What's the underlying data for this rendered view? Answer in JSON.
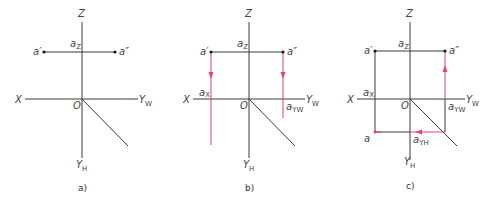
{
  "figure": {
    "panels": [
      {
        "id": "a",
        "caption": "a)",
        "labels": {
          "z": "Z",
          "x": "X",
          "o": "O",
          "yw": "Y",
          "yw_sub": "W",
          "yh": "Y",
          "yh_sub": "H",
          "a_front": "a′",
          "a_side": "a″",
          "az": "a",
          "az_sub": "Z"
        }
      },
      {
        "id": "b",
        "caption": "b)",
        "labels": {
          "z": "Z",
          "x": "X",
          "o": "O",
          "yw": "Y",
          "yw_sub": "W",
          "yh": "Y",
          "yh_sub": "H",
          "a_front": "a′",
          "a_side": "a″",
          "az": "a",
          "az_sub": "Z",
          "ax": "a",
          "ax_sub": "X",
          "ayw": "a",
          "ayw_sub": "YW"
        }
      },
      {
        "id": "c",
        "caption": "c)",
        "labels": {
          "z": "Z",
          "x": "X",
          "o": "O",
          "yw": "Y",
          "yw_sub": "W",
          "yh": "Y",
          "yh_sub": "H",
          "a_front": "a′",
          "a_side": "a″",
          "a_top": "a",
          "az": "a",
          "az_sub": "Z",
          "ax": "a",
          "ax_sub": "X",
          "ayw": "a",
          "ayw_sub": "YW",
          "ayh": "a",
          "ayh_sub": "YH"
        }
      }
    ],
    "colors": {
      "axis": "#3a3a3a",
      "projection_construction": "#e0456b"
    }
  }
}
